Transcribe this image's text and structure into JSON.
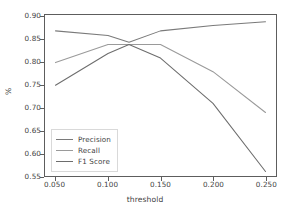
{
  "chart_data": {
    "type": "line",
    "title": "",
    "xlabel": "threshold",
    "ylabel": "%",
    "xlim": [
      0.04,
      0.26
    ],
    "ylim": [
      0.55,
      0.905
    ],
    "grid": false,
    "legend_position": "lower left",
    "xticks": [
      "0.050",
      "0.100",
      "0.150",
      "0.200",
      "0.250"
    ],
    "xtick_values": [
      0.05,
      0.1,
      0.15,
      0.2,
      0.25
    ],
    "yticks": [
      "0.55",
      "0.60",
      "0.65",
      "0.70",
      "0.75",
      "0.80",
      "0.85",
      "0.90"
    ],
    "ytick_values": [
      0.55,
      0.6,
      0.65,
      0.7,
      0.75,
      0.8,
      0.85,
      0.9
    ],
    "x": [
      0.05,
      0.1,
      0.12,
      0.15,
      0.2,
      0.25
    ],
    "series": [
      {
        "name": "Precision",
        "color": "#7a7a7a",
        "values": [
          0.87,
          0.86,
          0.845,
          0.87,
          0.882,
          0.89
        ]
      },
      {
        "name": "Recall",
        "color": "#9a9a9a",
        "values": [
          0.8,
          0.84,
          0.84,
          0.84,
          0.78,
          0.69
        ]
      },
      {
        "name": "F1 Score",
        "color": "#6d6d6d",
        "values": [
          0.75,
          0.82,
          0.84,
          0.81,
          0.71,
          0.56
        ]
      }
    ]
  },
  "legend": {
    "items": [
      {
        "label": "Precision"
      },
      {
        "label": "Recall"
      },
      {
        "label": "F1 Score"
      }
    ]
  },
  "axes": {
    "x_title": "threshold",
    "y_title": "%"
  },
  "colors": {
    "axis": "#5d5d5d",
    "text": "#3f3f3f",
    "background": "#ffffff"
  }
}
